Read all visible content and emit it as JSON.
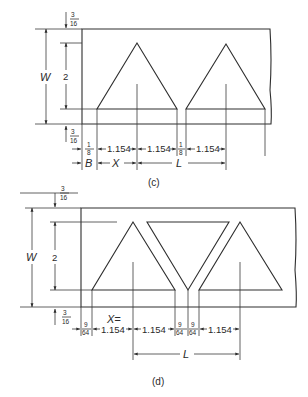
{
  "diagram_c": {
    "caption": "(c)",
    "top_margin": {
      "num": "3",
      "den": "16"
    },
    "bottom_margin": {
      "num": "3",
      "den": "16"
    },
    "width_label": "W",
    "height_label": "2",
    "row1": {
      "gap1": {
        "num": "1",
        "den": "8"
      },
      "seg1": "1.154",
      "seg2": "1.154",
      "gap2": {
        "num": "1",
        "den": "8"
      },
      "seg3": "1.154"
    },
    "row2": {
      "b": "B",
      "x": "X",
      "l": "L"
    }
  },
  "diagram_d": {
    "caption": "(d)",
    "top_margin": {
      "num": "3",
      "den": "16"
    },
    "bottom_margin": {
      "num": "3",
      "den": "16"
    },
    "width_label": "W",
    "height_label": "2",
    "x_eq": "X=",
    "row1": {
      "gap1": {
        "num": "9",
        "den": "64"
      },
      "seg1": "1.154",
      "seg2": "1.154",
      "gap2": {
        "num": "9",
        "den": "64"
      },
      "gap3": {
        "num": "9",
        "den": "64"
      },
      "seg3": "1.154"
    },
    "row2": {
      "l": "L"
    }
  }
}
